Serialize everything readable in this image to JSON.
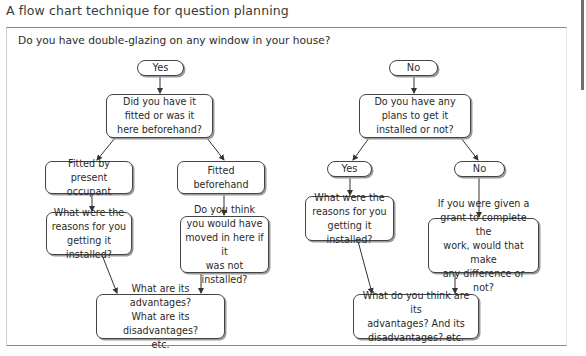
{
  "page": {
    "title": "A flow chart technique for question planning"
  },
  "flowchart": {
    "question": "Do you have double-glazing on any window in your house?",
    "yes_branch": {
      "answer": "Yes",
      "followup": "Did you have it\nfitted or was it\nhere beforehand?",
      "option_a": "Fitted by\npresent occupant",
      "option_b": "Fitted\nbeforehand",
      "option_a_question": "What were the\nreasons for you\ngetting it installed?",
      "option_b_question": "Do you think\nyou would have\nmoved in here if it\nwas not installed?",
      "final": "What are its advantages?\nWhat are its disadvantages?\netc."
    },
    "no_branch": {
      "answer": "No",
      "followup": "Do you have any\nplans to get it\ninstalled or not?",
      "option_a": "Yes",
      "option_b": "No",
      "option_a_question": "What were the\nreasons for you\ngetting it installed?",
      "option_b_question": "If you were given a\ngrant to complete the\nwork, would that make\nany difference or not?",
      "final": "What do you think are its\nadvantages? And its\ndisadvantages? etc."
    }
  },
  "colors": {
    "box_border": "#444444",
    "box_shadow": "#9a9a9a",
    "arrow": "#333333",
    "frame_rule": "#8a8a8a",
    "text": "#2a2a2a"
  }
}
